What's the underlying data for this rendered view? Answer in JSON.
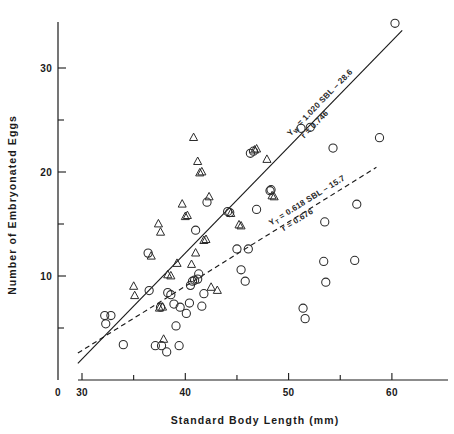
{
  "chart_data": {
    "type": "scatter",
    "title": "",
    "xlabel": "Standard Body Length  (mm)",
    "ylabel": "Number of Embryonated Eggs",
    "xlim": [
      28,
      64
    ],
    "ylim": [
      0,
      36
    ],
    "grid": false,
    "legend_position": "none",
    "x_ticks_major": [
      30,
      40,
      50,
      60
    ],
    "x_ticks_minor": [
      35,
      45,
      55
    ],
    "x_tick_labels": [
      "30",
      "40",
      "50",
      "60"
    ],
    "x_origin_label": "0",
    "y_ticks_major": [
      10,
      20,
      30
    ],
    "y_ticks_minor": [
      5,
      15,
      25
    ],
    "y_tick_labels": [
      "10",
      "20",
      "30"
    ],
    "annotations": [
      {
        "id": "regression-label-w",
        "line1": "Yw = 1.020 SBL – 28.6",
        "line2": "r = 0.746",
        "subscript": "W"
      },
      {
        "id": "regression-label-t",
        "line1": "YT = 0.618 SBL – 15.7",
        "line2": "r = 0.676",
        "subscript": "T"
      }
    ],
    "fits": [
      {
        "name": "Yw regression (solid)",
        "style": "solid",
        "slope": 1.02,
        "intercept": -28.6,
        "r": 0.746,
        "x_range": [
          29.6,
          61.0
        ]
      },
      {
        "name": "YT regression (dashed)",
        "style": "dashed",
        "slope": 0.618,
        "intercept": -15.7,
        "r": 0.676,
        "x_range": [
          29.6,
          58.5
        ]
      }
    ],
    "series": [
      {
        "name": "open-circle-series",
        "marker": "circle",
        "points": [
          [
            32.2,
            6.2
          ],
          [
            32.8,
            6.2
          ],
          [
            32.3,
            5.4
          ],
          [
            34.0,
            3.4
          ],
          [
            36.4,
            12.2
          ],
          [
            36.5,
            8.6
          ],
          [
            37.1,
            3.3
          ],
          [
            37.7,
            3.3
          ],
          [
            37.6,
            7.0
          ],
          [
            38.2,
            2.7
          ],
          [
            38.3,
            8.4
          ],
          [
            38.6,
            8.2
          ],
          [
            38.9,
            7.3
          ],
          [
            39.1,
            5.2
          ],
          [
            39.4,
            3.3
          ],
          [
            39.5,
            7.0
          ],
          [
            40.1,
            6.4
          ],
          [
            40.4,
            7.4
          ],
          [
            40.5,
            9.1
          ],
          [
            40.7,
            9.5
          ],
          [
            40.9,
            9.6
          ],
          [
            41.0,
            14.4
          ],
          [
            41.2,
            9.7
          ],
          [
            41.3,
            10.2
          ],
          [
            41.6,
            7.1
          ],
          [
            41.8,
            8.3
          ],
          [
            42.1,
            17.1
          ],
          [
            44.1,
            16.2
          ],
          [
            44.3,
            16.1
          ],
          [
            45.0,
            12.6
          ],
          [
            45.4,
            10.6
          ],
          [
            45.8,
            9.5
          ],
          [
            46.1,
            12.6
          ],
          [
            46.3,
            21.8
          ],
          [
            46.6,
            22.0
          ],
          [
            46.9,
            16.4
          ],
          [
            48.2,
            18.2
          ],
          [
            48.3,
            18.3
          ],
          [
            51.2,
            24.2
          ],
          [
            51.4,
            6.9
          ],
          [
            51.6,
            5.9
          ],
          [
            52.1,
            24.3
          ],
          [
            53.4,
            11.4
          ],
          [
            53.6,
            9.4
          ],
          [
            53.5,
            15.2
          ],
          [
            54.3,
            22.3
          ],
          [
            56.4,
            11.5
          ],
          [
            56.6,
            16.9
          ],
          [
            58.8,
            23.3
          ],
          [
            60.3,
            34.3
          ]
        ]
      },
      {
        "name": "open-triangle-series",
        "marker": "triangle",
        "points": [
          [
            35.0,
            9.0
          ],
          [
            35.1,
            8.1
          ],
          [
            36.7,
            11.9
          ],
          [
            37.4,
            15.0
          ],
          [
            37.5,
            6.9
          ],
          [
            37.8,
            7.0
          ],
          [
            37.6,
            14.2
          ],
          [
            37.9,
            3.9
          ],
          [
            38.3,
            10.1
          ],
          [
            38.6,
            10.0
          ],
          [
            39.2,
            11.2
          ],
          [
            39.7,
            16.9
          ],
          [
            40.0,
            15.7
          ],
          [
            40.2,
            15.8
          ],
          [
            40.6,
            11.1
          ],
          [
            40.8,
            23.3
          ],
          [
            41.0,
            12.2
          ],
          [
            41.2,
            21.0
          ],
          [
            41.4,
            19.9
          ],
          [
            41.6,
            20.0
          ],
          [
            41.8,
            13.4
          ],
          [
            42.0,
            13.5
          ],
          [
            42.3,
            17.6
          ],
          [
            42.5,
            8.9
          ],
          [
            43.1,
            8.6
          ],
          [
            44.4,
            16.0
          ],
          [
            45.2,
            14.9
          ],
          [
            45.4,
            14.8
          ],
          [
            46.7,
            22.1
          ],
          [
            46.9,
            22.2
          ],
          [
            47.9,
            21.2
          ],
          [
            48.4,
            17.7
          ],
          [
            48.6,
            17.6
          ]
        ]
      }
    ]
  }
}
